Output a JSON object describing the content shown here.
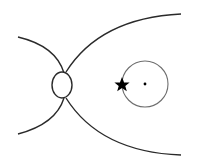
{
  "diagram": {
    "colors": {
      "background": "#ffffff",
      "curve_stroke": "#2a2a2a",
      "circle_stroke": "#6e6e6e",
      "star_fill": "#000000",
      "dot_fill": "#000000"
    },
    "elements": {
      "left_upper_curve": "curve",
      "left_lower_curve": "curve",
      "right_upper_curve": "curve",
      "right_lower_curve": "curve",
      "junction_ellipse": "ellipse",
      "orbit_circle": "circle",
      "center_dot": "dot",
      "star_marker": "star-icon"
    }
  }
}
